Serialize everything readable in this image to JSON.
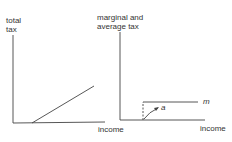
{
  "left_panel": {
    "y_label_line1": "total",
    "y_label_line2": "tax",
    "x_label": "income"
  },
  "right_panel": {
    "y_label_line1": "marginal and",
    "y_label_line2": "average tax",
    "x_label": "income",
    "marginal_label": "m",
    "average_label": "a"
  },
  "colors": {
    "ink": "#333333",
    "background": "#ffffff"
  }
}
